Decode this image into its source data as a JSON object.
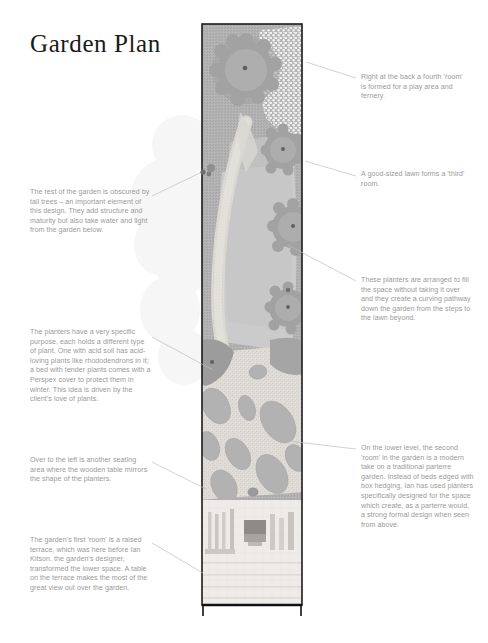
{
  "page": {
    "title": "Garden Plan"
  },
  "annotations": {
    "left": [
      {
        "name": "annotation-tall-trees",
        "text": "The rest of the garden is obscured by tall trees – an important element of this design. They add structure and maturity but also take water and light from the garden below."
      },
      {
        "name": "annotation-planters-purpose",
        "text": "The planters have a very specific purpose, each holds a different type of plant. One with acid soil has acid-loving plants like rhododendrons in it; a bed with tender plants comes with a Perspex cover to protect them in winter. This idea is driven by the client's love of plants."
      },
      {
        "name": "annotation-seating-area",
        "text": "Over to the left is another seating area where the wooden table mirrors the shape of the planters."
      },
      {
        "name": "annotation-first-room-terrace",
        "text": "The garden's first 'room' is a raised terrace, which was here before Ian Kitson, the garden's designer, transformed the lower space. A table on the terrace makes the most of the great view out over the garden."
      }
    ],
    "right": [
      {
        "name": "annotation-fourth-room",
        "text": "Right at the back a fourth 'room' is formed for a play area and fernery."
      },
      {
        "name": "annotation-lawn-third-room",
        "text": "A good-sized lawn forms a 'third' room."
      },
      {
        "name": "annotation-curving-pathway",
        "text": "These planters are arranged to fill the space without taking it over and they create a curving pathway down the garden from the steps to the lawn beyond."
      },
      {
        "name": "annotation-parterre-second-room",
        "text": "On the lower level, the second 'room' in the garden is a modern take on a traditional parterre garden. Instead of beds edged with box hedging, Ian has used planters specifically designed for the space which create, as a parterre would, a strong formal design when seen from above."
      }
    ]
  },
  "plan": {
    "label": "garden-plan-drawing",
    "colors": {
      "border": "#1b1b1b",
      "base_planting": "#b4b4b4",
      "lawn": "#c9c9c9",
      "path": "#dcdcdc",
      "terrace": "#e3e3e3",
      "canopy": "#a0a0a0",
      "planter": "#b0b0b0",
      "trunk": "#5a5a5a",
      "fernery": "#f2f2f2",
      "leader_line": "#b9b9b9"
    },
    "regions": [
      {
        "name": "fernery-play-area",
        "zone": "fourth room"
      },
      {
        "name": "lawn-area",
        "zone": "third room"
      },
      {
        "name": "parterre-planters",
        "zone": "second room"
      },
      {
        "name": "raised-terrace",
        "zone": "first room"
      }
    ]
  }
}
